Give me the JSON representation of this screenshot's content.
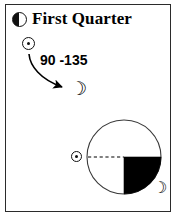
{
  "card": {
    "title": "First Quarter",
    "phase_icon": "half-moon-first-quarter-icon",
    "border_color": "#2b2b2b",
    "background": "#ffffff",
    "ink": "#000000"
  },
  "upper_diagram": {
    "sun_symbol": "sun-icon",
    "angle_label": "90 -135",
    "arrow": "curved-arrow-icon",
    "moon_symbol": "crescent-moon-icon"
  },
  "lower_diagram": {
    "sun_symbol": "sun-icon",
    "orbit_circle": "orbit-circle",
    "sun_ray": "dashed-sun-line",
    "illumination_wedge": "filled-quarter-wedge",
    "wedge_color": "#000000",
    "moon_symbol": "crescent-moon-icon"
  },
  "glyphs": {
    "crescent": "☽"
  }
}
